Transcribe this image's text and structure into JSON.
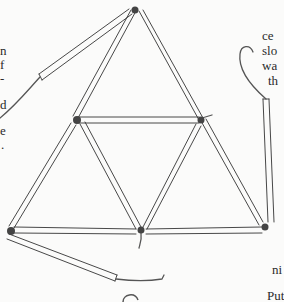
{
  "page": {
    "type": "scanned book page",
    "illustration": {
      "subject": "straws tied together with string forming a large triangle made of four smaller triangles, with loose straws and string ends"
    },
    "left_margin_fragments": [
      {
        "text": "n",
        "x": 0,
        "y": 44
      },
      {
        "text": "f",
        "x": 0,
        "y": 58
      },
      {
        "text": "-",
        "x": 0,
        "y": 72
      },
      {
        "text": "d",
        "x": 0,
        "y": 98
      },
      {
        "text": "e",
        "x": 0,
        "y": 124
      },
      {
        "text": ".",
        "x": 1,
        "y": 138
      }
    ],
    "right_margin_fragments": [
      {
        "text": "ce",
        "x": 262,
        "y": 29
      },
      {
        "text": "slo",
        "x": 262,
        "y": 44
      },
      {
        "text": "wa",
        "x": 262,
        "y": 59
      },
      {
        "text": "th",
        "x": 268,
        "y": 74
      },
      {
        "text": "ni",
        "x": 272,
        "y": 263
      },
      {
        "text": "Put",
        "x": 267,
        "y": 289
      }
    ],
    "colors": {
      "paper": "#fbfbfa",
      "ink": "#2a2a2a"
    }
  }
}
